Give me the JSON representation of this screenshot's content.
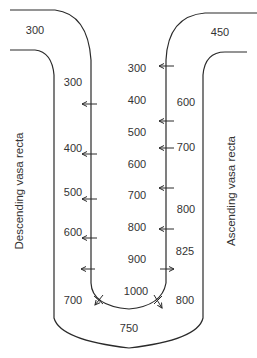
{
  "diagram": {
    "colors": {
      "line": "#2a2a2a",
      "text": "#333333",
      "background": "#ffffff"
    },
    "vessel_labels": {
      "descending": "Descending vasa recta",
      "ascending": "Ascending vasa recta"
    },
    "interstitium_values": [
      {
        "text": "300",
        "x": 137,
        "y": 68
      },
      {
        "text": "400",
        "x": 137,
        "y": 100
      },
      {
        "text": "500",
        "x": 137,
        "y": 132
      },
      {
        "text": "600",
        "x": 137,
        "y": 164
      },
      {
        "text": "700",
        "x": 137,
        "y": 195
      },
      {
        "text": "800",
        "x": 137,
        "y": 227
      },
      {
        "text": "900",
        "x": 137,
        "y": 259
      },
      {
        "text": "1000",
        "x": 136,
        "y": 291
      }
    ],
    "descending_values": [
      {
        "text": "300",
        "x": 35,
        "y": 30
      },
      {
        "text": "300",
        "x": 73,
        "y": 82
      },
      {
        "text": "400",
        "x": 73,
        "y": 148
      },
      {
        "text": "500",
        "x": 73,
        "y": 192
      },
      {
        "text": "600",
        "x": 73,
        "y": 232
      },
      {
        "text": "700",
        "x": 73,
        "y": 300
      }
    ],
    "ascending_values": [
      {
        "text": "450",
        "x": 220,
        "y": 32
      },
      {
        "text": "600",
        "x": 186,
        "y": 102
      },
      {
        "text": "700",
        "x": 186,
        "y": 147
      },
      {
        "text": "800",
        "x": 186,
        "y": 209
      },
      {
        "text": "825",
        "x": 185,
        "y": 251
      },
      {
        "text": "800",
        "x": 185,
        "y": 300
      }
    ],
    "bottom_value": {
      "text": "750",
      "x": 129,
      "y": 328
    },
    "arrows_left_wall": [
      104,
      154,
      199,
      238,
      269
    ],
    "arrows_right_wall_in": [
      66,
      121,
      148,
      188,
      229
    ],
    "arrows_right_wall_out": [
      269
    ]
  }
}
